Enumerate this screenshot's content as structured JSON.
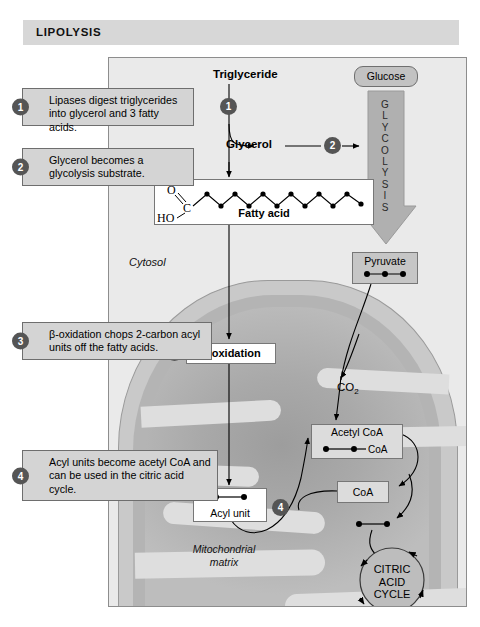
{
  "header": {
    "title": "LIPOLYSIS"
  },
  "diagram": {
    "compartments": {
      "cytosol": "Cytosol",
      "matrix_line1": "Mitochondrial",
      "matrix_line2": "matrix"
    },
    "molecules": {
      "triglyceride": "Triglyceride",
      "glycerol": "Glycerol",
      "fatty_acid": "Fatty acid",
      "glucose": "Glucose",
      "pyruvate": "Pyruvate",
      "acyl_unit": "Acyl unit",
      "acetyl_coa": "Acetyl CoA",
      "coa_tag": "CoA",
      "coa": "CoA",
      "co2": "CO",
      "co2_sub": "2",
      "beta_oxidation": "β-oxidation"
    },
    "glycolysis": {
      "label": "GLYCOLYSIS",
      "letters": [
        "G",
        "L",
        "Y",
        "C",
        "O",
        "L",
        "Y",
        "S",
        "I",
        "S"
      ]
    },
    "citric_acid_cycle": {
      "line1": "CITRIC",
      "line2": "ACID",
      "line3": "CYCLE"
    },
    "fatty_acid_structure": {
      "oxygen": "O",
      "carbon": "C",
      "hydroxyl": "HO",
      "chain_carbons": 13
    },
    "carbon_counts": {
      "pyruvate": 3,
      "acyl_unit": 2,
      "acetyl_coa": 2,
      "cycle_input": 2
    },
    "markers": [
      "1",
      "2",
      "3",
      "4"
    ]
  },
  "callouts": [
    {
      "number": "1",
      "text": "Lipases digest triglycerides into glycerol and 3 fatty acids."
    },
    {
      "number": "2",
      "text": "Glycerol becomes a glycolysis substrate."
    },
    {
      "number": "3",
      "text": "β-oxidation chops 2-carbon acyl units off the fatty acids."
    },
    {
      "number": "4",
      "text": "Acyl units become acetyl CoA and can be used in the citric acid cycle."
    }
  ],
  "colors": {
    "header_bg": "#d7d7d7",
    "frame_bg": "#eaeaea",
    "callout_bg": "#d4d4d4",
    "marker_bg": "#555555",
    "mito_outer": "#c9c9c9",
    "mito_matrix": "#a9a9a9",
    "crista": "#dedede",
    "arrow": "#b0b0b0"
  }
}
